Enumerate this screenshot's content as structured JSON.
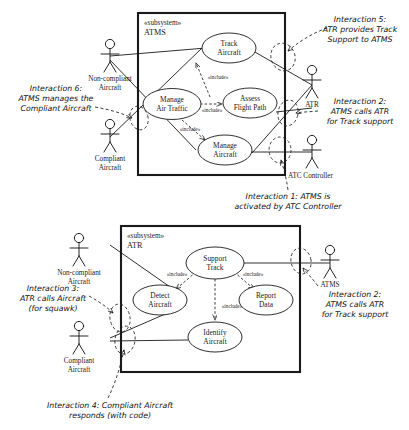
{
  "diagram": {
    "type": "uml-use-case-diagram",
    "colors": {
      "stroke": "#1a1a1a",
      "fill": "#ffffff",
      "note_text": "#111111"
    }
  },
  "subsystems": [
    {
      "id": "atms",
      "stereotype": "«subsystem»",
      "name": "ATMS",
      "use_cases": [
        {
          "id": "track-aircraft",
          "line1": "Track",
          "line2": "Aircraft"
        },
        {
          "id": "manage-air-traffic",
          "line1": "Manage",
          "line2": "Air Traffic"
        },
        {
          "id": "assess-flight-path",
          "line1": "Assess",
          "line2": "Flight Path"
        },
        {
          "id": "manage-aircraft",
          "line1": "Manage",
          "line2": "Aircraft"
        }
      ],
      "include_labels": [
        "«include»",
        "«include»",
        "«include»"
      ]
    },
    {
      "id": "atr",
      "stereotype": "«subsystem»",
      "name": "ATR",
      "use_cases": [
        {
          "id": "support-track",
          "line1": "Support",
          "line2": "Track"
        },
        {
          "id": "detect-aircraft",
          "line1": "Detect",
          "line2": "Aircraft"
        },
        {
          "id": "report-data",
          "line1": "Report",
          "line2": "Data"
        },
        {
          "id": "identify-aircraft",
          "line1": "Identify",
          "line2": "Aircraft"
        }
      ],
      "include_labels": [
        "«include»",
        "«include»",
        "«include»"
      ]
    }
  ],
  "actors": {
    "top": [
      {
        "id": "non-compliant-aircraft-top",
        "line1": "Non-compliant",
        "line2": "Aircraft"
      },
      {
        "id": "compliant-aircraft-top",
        "line1": "Compliant",
        "line2": "Aircraft"
      },
      {
        "id": "atr-actor-top",
        "line1": "ATR",
        "line2": ""
      },
      {
        "id": "atc-controller-top",
        "line1": "ATC Controller",
        "line2": ""
      }
    ],
    "bottom": [
      {
        "id": "non-compliant-aircraft-bottom",
        "line1": "Non-compliant",
        "line2": "Aircraft"
      },
      {
        "id": "compliant-aircraft-bottom",
        "line1": "Compliant",
        "line2": "Aircraft"
      },
      {
        "id": "atms-actor-bottom",
        "line1": "ATMS",
        "line2": ""
      }
    ]
  },
  "notes": [
    {
      "id": "interaction-6",
      "lines": [
        "Interaction 6:",
        "ATMS manages the",
        "Compliant Aircraft"
      ]
    },
    {
      "id": "interaction-5",
      "lines": [
        "Interaction 5:",
        "ATR provides Track",
        "Support to ATMS"
      ]
    },
    {
      "id": "interaction-2-top",
      "lines": [
        "Interaction 2:",
        "ATMS calls ATR",
        "for Track support"
      ]
    },
    {
      "id": "interaction-1",
      "lines": [
        "Interaction 1: ATMS is",
        "activated by ATC Controller"
      ]
    },
    {
      "id": "interaction-3",
      "lines": [
        "Interaction 3:",
        "ATR calls Aircraft",
        "(for squawk)"
      ]
    },
    {
      "id": "interaction-2-bottom",
      "lines": [
        "Interaction 2:",
        "ATMS calls ATR",
        "for Track support"
      ]
    },
    {
      "id": "interaction-4",
      "lines": [
        "Interaction 4: Compliant Aircraft",
        "responds (with code)"
      ]
    }
  ]
}
